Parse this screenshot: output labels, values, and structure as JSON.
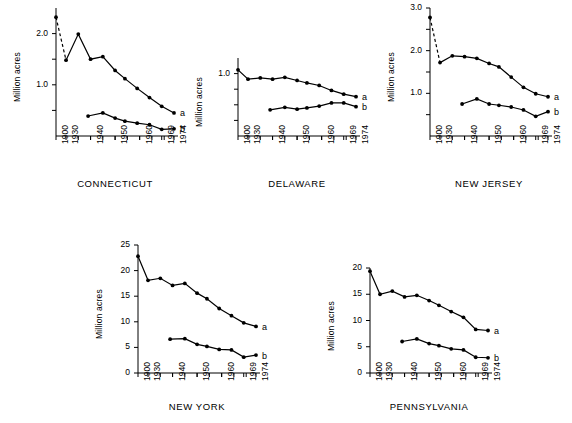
{
  "figure": {
    "ylabel": "Million acres",
    "series_labels": {
      "a": "a",
      "b": "b"
    },
    "xticklabels": [
      "1900",
      "1930",
      "1940",
      "1950",
      "1960",
      "1969",
      "1974"
    ]
  },
  "chart_data": [
    {
      "type": "line",
      "title": "CONNECTICUT",
      "xlabel": "",
      "ylabel": "Million acres",
      "ylim": [
        0,
        2.5
      ],
      "yticks": [
        0.5,
        1.0,
        1.5,
        2.0
      ],
      "yticklabels": [
        "",
        "1.0",
        "",
        "2.0"
      ],
      "xlim": [
        1900,
        1974
      ],
      "xticks": [
        1900,
        1930,
        1940,
        1950,
        1960,
        1969,
        1974
      ],
      "xticklabels": [
        "1900",
        "1930",
        "1940",
        "1950",
        "1960",
        "1969",
        "1974"
      ],
      "grid": false,
      "legend_position": "right-inline",
      "series": [
        {
          "name": "a",
          "dashed_first_segment": true,
          "x": [
            1900,
            1930,
            1935,
            1940,
            1945,
            1950,
            1954,
            1959,
            1964,
            1969,
            1974
          ],
          "values": [
            2.32,
            1.48,
            1.99,
            1.5,
            1.55,
            1.28,
            1.12,
            0.93,
            0.75,
            0.58,
            0.45
          ]
        },
        {
          "name": "b",
          "dashed_first_segment": false,
          "x": [
            1939,
            1945,
            1950,
            1954,
            1959,
            1964,
            1969,
            1974
          ],
          "values": [
            0.39,
            0.45,
            0.35,
            0.29,
            0.25,
            0.22,
            0.13,
            0.14
          ]
        }
      ]
    },
    {
      "type": "line",
      "title": "DELAWARE",
      "xlabel": "",
      "ylabel": "Million acres",
      "ylim": [
        0,
        1.25
      ],
      "yticks": [
        0.25,
        0.5,
        0.75,
        1.0
      ],
      "yticklabels": [
        "",
        "",
        "",
        "1.0"
      ],
      "xlim": [
        1900,
        1974
      ],
      "xticks": [
        1900,
        1930,
        1940,
        1950,
        1960,
        1969,
        1974
      ],
      "xticklabels": [
        "1900",
        "1930",
        "1940",
        "1950",
        "1960",
        "1969",
        "1974"
      ],
      "grid": false,
      "legend_position": "right-inline",
      "series": [
        {
          "name": "a",
          "dashed_first_segment": false,
          "x": [
            1900,
            1930,
            1935,
            1940,
            1945,
            1950,
            1954,
            1959,
            1964,
            1969,
            1974
          ],
          "values": [
            1.06,
            0.91,
            0.93,
            0.91,
            0.94,
            0.89,
            0.85,
            0.81,
            0.73,
            0.67,
            0.63
          ]
        },
        {
          "name": "b",
          "dashed_first_segment": false,
          "x": [
            1939,
            1945,
            1950,
            1954,
            1959,
            1964,
            1969,
            1974
          ],
          "values": [
            0.42,
            0.46,
            0.43,
            0.45,
            0.48,
            0.53,
            0.53,
            0.47
          ]
        }
      ]
    },
    {
      "type": "line",
      "title": "NEW JERSEY",
      "xlabel": "",
      "ylabel": "Million acres",
      "ylim": [
        0,
        3.0
      ],
      "yticks": [
        0.5,
        1.0,
        1.5,
        2.0,
        2.5,
        3.0
      ],
      "yticklabels": [
        "",
        "1.0",
        "",
        "2.0",
        "",
        "3.0"
      ],
      "xlim": [
        1900,
        1974
      ],
      "xticks": [
        1900,
        1930,
        1940,
        1950,
        1960,
        1969,
        1974
      ],
      "xticklabels": [
        "1900",
        "1930",
        "1940",
        "1950",
        "1960",
        "1969",
        "1974"
      ],
      "grid": false,
      "legend_position": "right-inline",
      "series": [
        {
          "name": "a",
          "dashed_first_segment": true,
          "x": [
            1900,
            1930,
            1935,
            1940,
            1945,
            1950,
            1954,
            1959,
            1964,
            1969,
            1974
          ],
          "values": [
            2.78,
            1.72,
            1.88,
            1.86,
            1.82,
            1.7,
            1.62,
            1.38,
            1.14,
            0.99,
            0.92
          ]
        },
        {
          "name": "b",
          "dashed_first_segment": false,
          "x": [
            1939,
            1945,
            1950,
            1954,
            1959,
            1964,
            1969,
            1974
          ],
          "values": [
            0.75,
            0.87,
            0.75,
            0.72,
            0.68,
            0.61,
            0.46,
            0.57
          ]
        }
      ]
    },
    {
      "type": "line",
      "title": "NEW YORK",
      "xlabel": "",
      "ylabel": "Million acres",
      "ylim": [
        0,
        25
      ],
      "yticks": [
        0,
        5,
        10,
        15,
        20,
        25
      ],
      "yticklabels": [
        "0",
        "5",
        "10",
        "15",
        "20",
        "25"
      ],
      "xlim": [
        1900,
        1974
      ],
      "xticks": [
        1900,
        1930,
        1940,
        1950,
        1960,
        1969,
        1974
      ],
      "xticklabels": [
        "1900",
        "1930",
        "1940",
        "1950",
        "1960",
        "1969",
        "1974"
      ],
      "grid": false,
      "legend_position": "right-inline",
      "series": [
        {
          "name": "a",
          "dashed_first_segment": false,
          "x": [
            1900,
            1930,
            1935,
            1940,
            1945,
            1950,
            1954,
            1959,
            1964,
            1969,
            1974
          ],
          "values": [
            22.8,
            18.1,
            18.5,
            17.1,
            17.5,
            15.6,
            14.5,
            12.6,
            11.2,
            9.8,
            9.1
          ]
        },
        {
          "name": "b",
          "dashed_first_segment": false,
          "x": [
            1939,
            1945,
            1950,
            1954,
            1959,
            1964,
            1969,
            1974
          ],
          "values": [
            6.6,
            6.7,
            5.6,
            5.2,
            4.6,
            4.5,
            3.1,
            3.5
          ]
        }
      ]
    },
    {
      "type": "line",
      "title": "PENNSYLVANIA",
      "xlabel": "",
      "ylabel": "Million acres",
      "ylim": [
        0,
        20
      ],
      "yticks": [
        0,
        5,
        10,
        15,
        20
      ],
      "yticklabels": [
        "0",
        "5",
        "10",
        "15",
        "20"
      ],
      "xlim": [
        1900,
        1974
      ],
      "xticks": [
        1900,
        1930,
        1940,
        1950,
        1960,
        1969,
        1974
      ],
      "xticklabels": [
        "1900",
        "1930",
        "1940",
        "1950",
        "1960",
        "1969",
        "1974"
      ],
      "grid": false,
      "legend_position": "right-inline",
      "series": [
        {
          "name": "a",
          "dashed_first_segment": false,
          "x": [
            1900,
            1930,
            1935,
            1940,
            1945,
            1950,
            1954,
            1959,
            1964,
            1969,
            1974
          ],
          "values": [
            19.4,
            15.0,
            15.6,
            14.5,
            14.8,
            13.8,
            12.9,
            11.7,
            10.6,
            8.3,
            8.1
          ]
        },
        {
          "name": "b",
          "dashed_first_segment": false,
          "x": [
            1939,
            1945,
            1950,
            1954,
            1959,
            1964,
            1969,
            1974
          ],
          "values": [
            6.0,
            6.5,
            5.6,
            5.2,
            4.6,
            4.4,
            3.0,
            2.9
          ]
        }
      ]
    }
  ],
  "panels": [
    {
      "key": 0,
      "left": 14,
      "top": 8,
      "plot_w": 118,
      "plot_h": 128,
      "title_y": 178,
      "title_w": 150
    },
    {
      "key": 1,
      "left": 196,
      "top": 58,
      "plot_w": 118,
      "plot_h": 78,
      "title_y": 178,
      "title_w": 150
    },
    {
      "key": 2,
      "left": 388,
      "top": 8,
      "plot_w": 118,
      "plot_h": 128,
      "title_y": 178,
      "title_w": 150
    },
    {
      "key": 3,
      "left": 96,
      "top": 245,
      "plot_w": 118,
      "plot_h": 128,
      "title_y": 401,
      "title_w": 150
    },
    {
      "key": 4,
      "left": 328,
      "top": 268,
      "plot_w": 118,
      "plot_h": 105,
      "title_y": 401,
      "title_w": 150
    }
  ]
}
